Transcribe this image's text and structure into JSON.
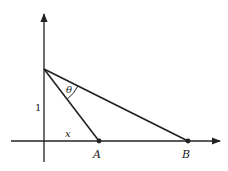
{
  "diagram": {
    "axes": {
      "x_axis": {
        "has_arrow": true
      },
      "y_axis": {
        "has_arrow": true
      }
    },
    "points": {
      "A": {
        "label": "A"
      },
      "B": {
        "label": "B"
      }
    },
    "labels": {
      "height": "1",
      "base": "x",
      "angle": "θ"
    },
    "colors": {
      "stroke": "#222222",
      "background": "#ffffff"
    }
  }
}
